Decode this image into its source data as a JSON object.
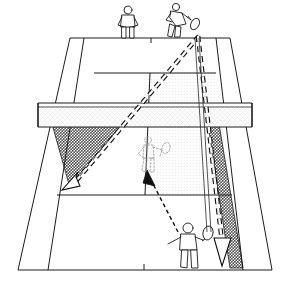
{
  "diagram": {
    "view": "perspective-from-baseline",
    "surface_color": "#ffffff",
    "line_color": "#1c1c1c",
    "shade_dark_color": "#808080",
    "shade_light_color": "#ececec",
    "trajectory_color": "#111111",
    "caption": ""
  },
  "court": {
    "name": "tennis-court",
    "lines": [
      {
        "name": "far-baseline",
        "label": "Far baseline"
      },
      {
        "name": "near-baseline",
        "label": "Near baseline"
      },
      {
        "name": "far-service-line",
        "label": "Far service line"
      },
      {
        "name": "near-service-line",
        "label": "Near service line"
      },
      {
        "name": "center-service-line",
        "label": "Center service line"
      },
      {
        "name": "left-singles-sideline",
        "label": "Left singles sideline"
      },
      {
        "name": "right-singles-sideline",
        "label": "Right singles sideline"
      },
      {
        "name": "left-doubles-sideline",
        "label": "Left doubles sideline"
      },
      {
        "name": "right-doubles-sideline",
        "label": "Right doubles sideline"
      },
      {
        "name": "far-center-mark",
        "label": "Far center mark"
      },
      {
        "name": "near-center-mark",
        "label": "Near center mark"
      }
    ]
  },
  "net": {
    "name": "tennis-net",
    "label": "Net",
    "band_color": "#fdfdfd",
    "mesh_color": "#b9b9b9"
  },
  "zones": [
    {
      "name": "zone-crosscourt-target",
      "label": "Cross-court target zone",
      "shade": "dark",
      "side": "near-left",
      "color": "#808080"
    },
    {
      "name": "zone-down-the-line-alley",
      "label": "Down-the-line alley zone",
      "shade": "dark",
      "side": "near-right",
      "color": "#808080"
    },
    {
      "name": "zone-far-service-box",
      "label": "Far deuce service box coverage",
      "shade": "light",
      "side": "far-right",
      "color": "#ececec"
    }
  ],
  "trajectories": [
    {
      "name": "shot-crosscourt",
      "label": "Cross-court shot",
      "style": "dashed-thick",
      "arrowhead": "open",
      "from": "far-right-baseline",
      "to": "near-left-sideline"
    },
    {
      "name": "shot-down-the-line",
      "label": "Down-the-line shot",
      "style": "dashed-thick",
      "arrowhead": "open",
      "from": "far-right-baseline",
      "to": "near-right-baseline"
    },
    {
      "name": "movement-recovery",
      "label": "Player recovery movement",
      "style": "dashed-thin",
      "arrowhead": "solid",
      "from": "near-right-player",
      "to": "court-center"
    }
  ],
  "players": [
    {
      "name": "player-far-left",
      "label": "Far court partner standing at baseline",
      "position": "far-baseline-left",
      "style": "solid",
      "has_racket": false
    },
    {
      "name": "player-far-right-server",
      "label": "Far court player striking the ball",
      "position": "far-baseline-right",
      "style": "solid",
      "has_racket": true
    },
    {
      "name": "player-center-ghost",
      "label": "Ghosted recovery position",
      "position": "court-center",
      "style": "ghost",
      "has_racket": true
    },
    {
      "name": "player-near-right",
      "label": "Near court player with racket",
      "position": "near-right-court",
      "style": "solid",
      "has_racket": true
    }
  ]
}
